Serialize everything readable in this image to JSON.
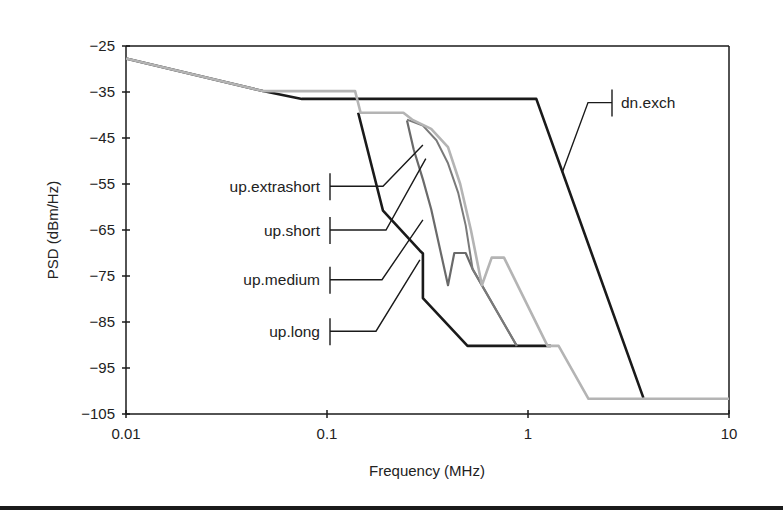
{
  "chart_data": {
    "type": "line",
    "title": "",
    "xlabel": "Frequency (MHz)",
    "ylabel": "PSD (dBm/Hz)",
    "xscale": "log",
    "xlim": [
      0.01,
      10
    ],
    "ylim": [
      -105,
      -25
    ],
    "grid": false,
    "legend": "inline leader-line labels",
    "x_ticks": [
      {
        "value": 0.01,
        "label": "0.01"
      },
      {
        "value": 0.1,
        "label": "0.1"
      },
      {
        "value": 1,
        "label": "1"
      },
      {
        "value": 10,
        "label": "10"
      }
    ],
    "y_ticks": [
      {
        "value": -25,
        "label": "−25"
      },
      {
        "value": -35,
        "label": "−35"
      },
      {
        "value": -45,
        "label": "−45"
      },
      {
        "value": -55,
        "label": "−55"
      },
      {
        "value": -65,
        "label": "−65"
      },
      {
        "value": -75,
        "label": "−75"
      },
      {
        "value": -85,
        "label": "−85"
      },
      {
        "value": -95,
        "label": "−95"
      },
      {
        "value": -105,
        "label": "−105"
      }
    ],
    "series": [
      {
        "name": "dn.exch",
        "color": "#1a1a1a",
        "width": 2.6,
        "points": [
          [
            0.01,
            -27.7
          ],
          [
            0.048,
            -34.8
          ],
          [
            0.075,
            -36.5
          ],
          [
            1.1,
            -36.5
          ],
          [
            3.75,
            -101.5
          ]
        ]
      },
      {
        "name": "up.long",
        "color": "#1a1a1a",
        "width": 2.6,
        "points": [
          [
            0.143,
            -39.5
          ],
          [
            0.19,
            -60.8
          ],
          [
            0.29,
            -69.5
          ],
          [
            0.3,
            -70.1
          ],
          [
            0.3,
            -79.8
          ],
          [
            0.5,
            -90.2
          ],
          [
            1.3,
            -90.2
          ]
        ]
      },
      {
        "name": "up.medium",
        "color": "#6a6a6a",
        "width": 2.2,
        "points": [
          [
            0.25,
            -41.2
          ],
          [
            0.27,
            -47.5
          ],
          [
            0.3,
            -54
          ],
          [
            0.33,
            -60.5
          ],
          [
            0.4,
            -77
          ],
          [
            0.43,
            -70
          ],
          [
            0.49,
            -70
          ],
          [
            0.53,
            -73.5
          ],
          [
            0.88,
            -90.2
          ]
        ]
      },
      {
        "name": "up.short",
        "color": "#7a7a7a",
        "width": 2.0,
        "points": [
          [
            0.25,
            -41
          ],
          [
            0.3,
            -42.3
          ],
          [
            0.35,
            -45.5
          ],
          [
            0.4,
            -50.5
          ],
          [
            0.45,
            -57
          ],
          [
            0.49,
            -64
          ],
          [
            0.53,
            -73.5
          ],
          [
            0.88,
            -90.2
          ]
        ]
      },
      {
        "name": "up.extrashort",
        "color": "#b4b4b4",
        "width": 2.6,
        "points": [
          [
            0.01,
            -27.7
          ],
          [
            0.048,
            -34.8
          ],
          [
            0.138,
            -34.8
          ],
          [
            0.147,
            -39.5
          ],
          [
            0.24,
            -39.5
          ],
          [
            0.265,
            -41
          ],
          [
            0.33,
            -43
          ],
          [
            0.4,
            -47
          ],
          [
            0.46,
            -55
          ],
          [
            0.52,
            -65
          ],
          [
            0.59,
            -77
          ],
          [
            0.66,
            -71
          ],
          [
            0.76,
            -71
          ],
          [
            1.25,
            -90.2
          ],
          [
            1.42,
            -90.2
          ],
          [
            2.0,
            -101.7
          ],
          [
            10,
            -101.7
          ]
        ]
      }
    ],
    "annotations": [
      {
        "series": "up.extrashort",
        "text": "up.extrashort",
        "label_y": -55.5,
        "tick_x": 330,
        "elbow_x": 383,
        "target": [
          0.3,
          -46.5
        ]
      },
      {
        "series": "up.short",
        "text": "up.short",
        "label_y": -65,
        "tick_x": 330,
        "elbow_x": 386,
        "target": [
          0.31,
          -49.5
        ]
      },
      {
        "series": "up.medium",
        "text": "up.medium",
        "label_y": -75.8,
        "tick_x": 330,
        "elbow_x": 382,
        "target": [
          0.3,
          -62.8
        ]
      },
      {
        "series": "up.long",
        "text": "up.long",
        "label_y": -87,
        "tick_x": 330,
        "elbow_x": 376,
        "target": [
          0.29,
          -71.5
        ]
      },
      {
        "series": "dn.exch",
        "text": "dn.exch",
        "label_y": -37.3,
        "tick_x": 612,
        "elbow_x": 588,
        "target": [
          1.48,
          -52.5
        ]
      }
    ]
  }
}
